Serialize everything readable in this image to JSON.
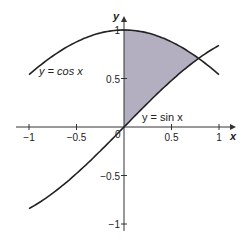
{
  "chart_data": {
    "type": "area",
    "title": "",
    "xlabel": "x",
    "ylabel": "y",
    "xlim": [
      -1,
      1
    ],
    "ylim": [
      -1,
      1
    ],
    "grid": false,
    "x_ticks": [
      -1,
      -0.5,
      0.5,
      1
    ],
    "x_tick_labels": [
      "−1",
      "−0.5",
      "0.5",
      "1"
    ],
    "y_ticks": [
      1,
      0.5,
      -0.5,
      -1
    ],
    "y_tick_labels": [
      "1",
      "0.5",
      "−0.5",
      "−1"
    ],
    "origin_label": "0",
    "series": [
      {
        "name": "y = cos x",
        "function": "cos",
        "domain": [
          -1,
          1
        ],
        "color": "#222222",
        "x": [
          -1,
          -0.5,
          0,
          0.5,
          0.785,
          1
        ],
        "values": [
          0.54,
          0.878,
          1,
          0.878,
          0.707,
          0.54
        ]
      },
      {
        "name": "y = sin x",
        "function": "sin",
        "domain": [
          -1,
          1
        ],
        "color": "#222222",
        "x": [
          -1,
          -0.5,
          0,
          0.5,
          0.785,
          1
        ],
        "values": [
          -0.841,
          -0.479,
          0,
          0.479,
          0.707,
          0.841
        ]
      }
    ],
    "shaded_region": {
      "between": [
        "y = cos x",
        "y = sin x"
      ],
      "x_range": [
        0,
        0.785
      ],
      "color": "#b3aec0"
    },
    "annotations": [
      {
        "text": "y = cos x",
        "x": -0.72,
        "y": 0.57
      },
      {
        "text": "y = sin x",
        "x": 0.58,
        "y": 0.1
      }
    ],
    "intersection": {
      "x": 0.785,
      "y": 0.707
    }
  },
  "labels": {
    "x_axis": "x",
    "y_axis": "y",
    "cos_curve": "y = cos x",
    "sin_curve": "y = sin x",
    "origin": "0"
  }
}
